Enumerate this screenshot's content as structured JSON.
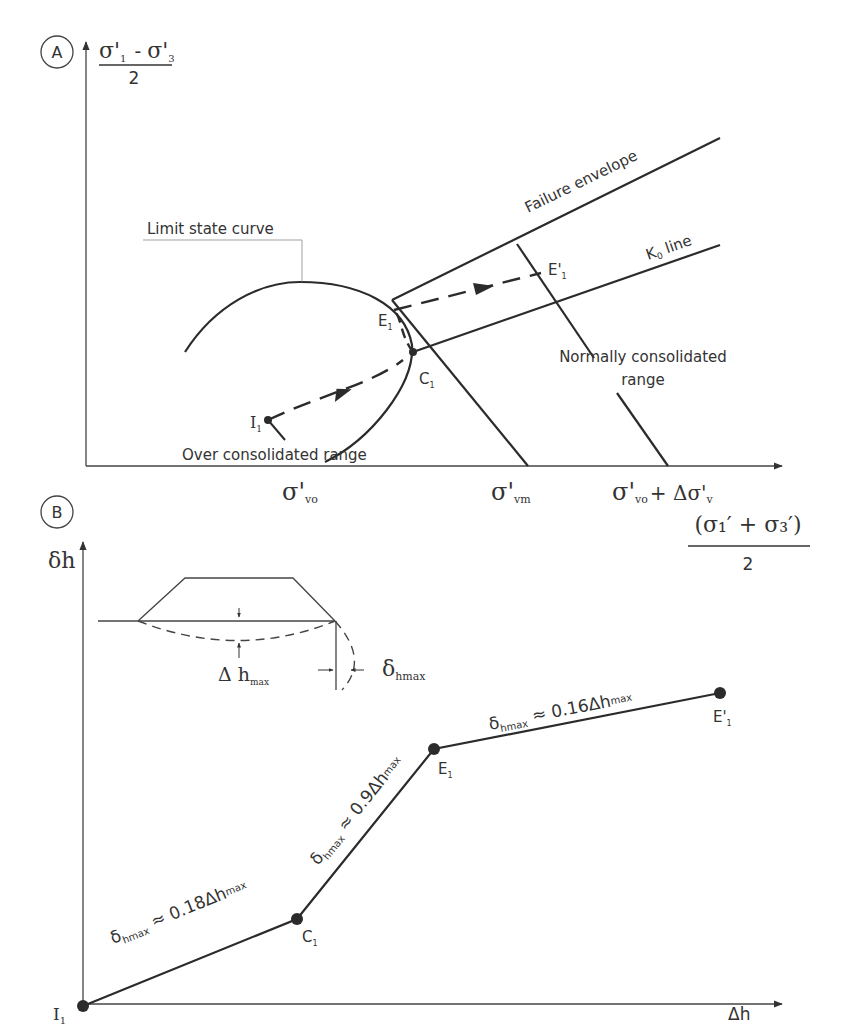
{
  "panel_a": {
    "badge": "A",
    "y_axis_label": {
      "numerator_left": "σ'",
      "sub1": "1",
      "minus": "-",
      "numerator_right": "σ'",
      "sub3": "3",
      "denominator": "2"
    },
    "x_ticks": [
      {
        "main": "σ'",
        "sub": "vo"
      },
      {
        "main": "σ'",
        "sub": "vm"
      },
      {
        "main": "σ'",
        "sub": "vo",
        "plus": "+ Δσ'",
        "sub2": "v"
      }
    ],
    "x_axis_label": {
      "numerator": "(σ₁′ + σ₃′)",
      "denominator": "2"
    },
    "labels": {
      "limit_state_curve": "Limit state curve",
      "failure_envelope": "Failure envelope",
      "k0_line": "K",
      "k0_sub": "0",
      "k0_suffix": " line",
      "normally_consolidated_1": "Normally consolidated",
      "normally_consolidated_2": "range",
      "over_consolidated": "Over consolidated range"
    },
    "points": [
      {
        "id": "I1",
        "main": "I",
        "sub": "1"
      },
      {
        "id": "C1",
        "main": "C",
        "sub": "1"
      },
      {
        "id": "E1",
        "main": "E",
        "sub": "1"
      },
      {
        "id": "E'1",
        "main": "E'",
        "sub": "1"
      }
    ]
  },
  "panel_b": {
    "badge": "B",
    "y_axis_label": "δh",
    "x_axis_label": "Δh",
    "inset": {
      "delta_h_max": {
        "main": "Δ h",
        "sub": "max"
      },
      "delta_hmax": {
        "main": "δ",
        "sub": "hmax"
      }
    },
    "points": [
      {
        "id": "I1",
        "main": "I",
        "sub": "1"
      },
      {
        "id": "C1",
        "main": "C",
        "sub": "1"
      },
      {
        "id": "E1",
        "main": "E",
        "sub": "1"
      },
      {
        "id": "E'1",
        "main": "E'",
        "sub": "1"
      }
    ],
    "segments": [
      {
        "prefix": "δ",
        "sub": "hmax",
        "eq": " ≈ 0.18Δh",
        "sub2": "max"
      },
      {
        "prefix": "δ",
        "sub": "hmax",
        "eq": " ≈ 0.9Δh",
        "sub2": "max"
      },
      {
        "prefix": "δ",
        "sub": "hmax",
        "eq": " ≈ 0.16Δh",
        "sub2": "max"
      }
    ]
  },
  "colors": {
    "ink": "#2b2b2b",
    "background": "#ffffff"
  }
}
